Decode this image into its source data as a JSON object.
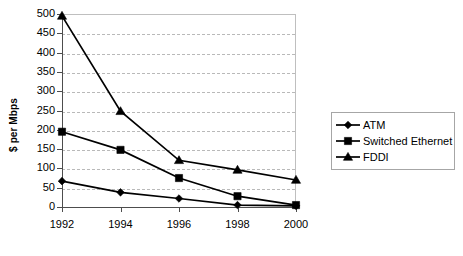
{
  "chart_data": {
    "type": "line",
    "title": "",
    "xlabel": "",
    "ylabel": "$ per Mbps",
    "categories": [
      "1992",
      "1994",
      "1996",
      "1998",
      "2000"
    ],
    "x": [
      1992,
      1994,
      1996,
      1998,
      2000
    ],
    "ylim": [
      0,
      500
    ],
    "ytick_step": 50,
    "yticks": [
      500,
      450,
      400,
      350,
      300,
      250,
      200,
      150,
      100,
      50,
      0
    ],
    "ytick_labels": [
      "500",
      "450",
      "400",
      "350",
      "300",
      "250",
      "200",
      "150",
      "100",
      "50",
      "0"
    ],
    "grid": "horizontal-dashed",
    "legend_position": "right",
    "series": [
      {
        "name": "ATM",
        "marker": "diamond",
        "color": "#000000",
        "values": [
          67,
          38,
          22,
          5,
          3
        ]
      },
      {
        "name": "Switched Ethernet",
        "marker": "square",
        "color": "#000000",
        "values": [
          195,
          148,
          75,
          28,
          5
        ]
      },
      {
        "name": "FDDI",
        "marker": "triangle",
        "color": "#000000",
        "values": [
          495,
          248,
          121,
          96,
          70
        ]
      }
    ]
  },
  "legend": {
    "items": [
      {
        "label": "ATM",
        "marker": "diamond-marker-icon"
      },
      {
        "label": "Switched Ethernet",
        "marker": "square-marker-icon"
      },
      {
        "label": "FDDI",
        "marker": "triangle-marker-icon"
      }
    ]
  },
  "axes": {
    "y_title": "$ per Mbps"
  },
  "colors": {
    "series": "#000000",
    "gridline": "#b9b9b9",
    "axis": "#4d4d4d",
    "frame": "#bfbfbf",
    "background": "#ffffff",
    "legend_border": "#a6a6a6"
  }
}
